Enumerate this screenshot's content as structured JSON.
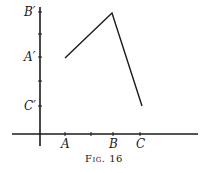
{
  "figure": {
    "caption": "Fig. 16",
    "x_labels": [
      {
        "id": "A",
        "text": "A"
      },
      {
        "id": "B",
        "text": "B"
      },
      {
        "id": "C",
        "text": "C"
      }
    ],
    "y_labels": [
      {
        "id": "B_prime",
        "text": "B′"
      },
      {
        "id": "A_prime",
        "text": "A′"
      },
      {
        "id": "C_prime",
        "text": "C′"
      }
    ],
    "polyline": {
      "description": "Broken line connecting (A, A′), (B, B′), (C, C′)",
      "points": [
        {
          "x_label": "A",
          "y_label": "A′"
        },
        {
          "x_label": "B",
          "y_label": "B′"
        },
        {
          "x_label": "C",
          "y_label": "C′"
        }
      ]
    },
    "colors": {
      "ink": "#1a1a1a",
      "background": "#ffffff"
    }
  }
}
